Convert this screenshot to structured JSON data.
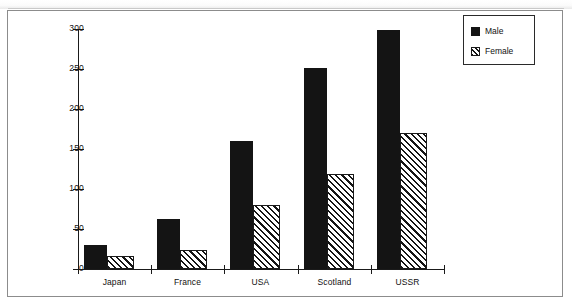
{
  "chart_data": {
    "type": "bar",
    "title": "",
    "subtitle": "",
    "xlabel": "",
    "ylabel": "",
    "categories": [
      "Japan",
      "France",
      "USA",
      "Scotland",
      "USSR"
    ],
    "series": [
      {
        "name": "Male",
        "values": [
          30,
          62,
          160,
          251,
          299
        ]
      },
      {
        "name": "Female",
        "values": [
          16,
          24,
          80,
          119,
          170
        ]
      }
    ],
    "ylim": [
      0,
      300
    ],
    "yticks": [
      0,
      50,
      100,
      150,
      200,
      250,
      300
    ],
    "ytick_labels": [
      "0",
      "50",
      "100",
      "150",
      "200",
      "250",
      "300"
    ],
    "grid": false,
    "legend_position": "top-right",
    "legend": [
      {
        "label": "Male",
        "swatch": "solid-black",
        "color": "#141414"
      },
      {
        "label": "Female",
        "swatch": "diagonal-hatch",
        "color": "#151515"
      }
    ]
  },
  "figure": {
    "frame_color": "#8c8c8c",
    "axis_color": "#1a1a1a",
    "background": "#ffffff"
  }
}
